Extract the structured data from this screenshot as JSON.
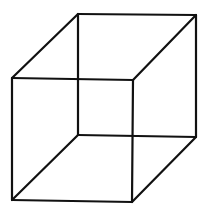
{
  "diagram": {
    "type": "necker-cube",
    "stroke_color": "#111111",
    "background": "#ffffff",
    "vertices": {
      "back_tl": [
        78,
        14
      ],
      "back_tr": [
        196,
        15
      ],
      "back_br": [
        196,
        137
      ],
      "back_bl": [
        78,
        135
      ],
      "front_tl": [
        12,
        78
      ],
      "front_tr": [
        133,
        80
      ],
      "front_br": [
        132,
        202
      ],
      "front_bl": [
        12,
        200
      ]
    },
    "edges": [
      [
        "back_tl",
        "back_tr"
      ],
      [
        "back_tr",
        "back_br"
      ],
      [
        "back_br",
        "back_bl"
      ],
      [
        "back_bl",
        "back_tl"
      ],
      [
        "front_tl",
        "front_tr"
      ],
      [
        "front_tr",
        "front_br"
      ],
      [
        "front_br",
        "front_bl"
      ],
      [
        "front_bl",
        "front_tl"
      ],
      [
        "front_tl",
        "back_tl"
      ],
      [
        "front_tr",
        "back_tr"
      ],
      [
        "front_br",
        "back_br"
      ],
      [
        "front_bl",
        "back_bl"
      ]
    ]
  }
}
